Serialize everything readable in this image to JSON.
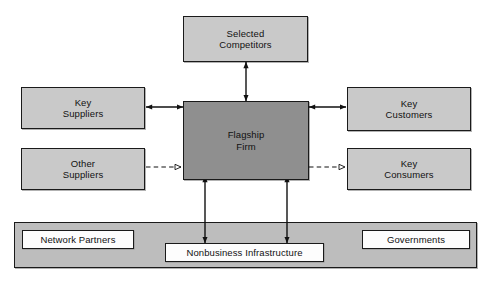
{
  "diagram": {
    "colors": {
      "node_fill": "#c9c9c9",
      "center_fill": "#8f8f8f",
      "envelope_fill": "#bdbdbd",
      "white_fill": "#fdfdfd",
      "stroke": "#1a1a1a",
      "background": "#ffffff"
    },
    "nodes": {
      "selected_competitors": {
        "line1": "Selected",
        "line2": "Competitors"
      },
      "key_suppliers": {
        "line1": "Key",
        "line2": "Suppliers"
      },
      "other_suppliers": {
        "line1": "Other",
        "line2": "Suppliers"
      },
      "flagship_firm": {
        "line1": "Flagship",
        "line2": "Firm"
      },
      "key_customers": {
        "line1": "Key",
        "line2": "Customers"
      },
      "key_consumers": {
        "line1": "Key",
        "line2": "Consumers"
      },
      "network_partners": {
        "label": "Network Partners"
      },
      "nonbusiness_infrastructure": {
        "label": "Nonbusiness Infrastructure"
      },
      "governments": {
        "label": "Governments"
      }
    },
    "connectors": [
      {
        "name": "flagship-to-selected-competitors",
        "style": "solid",
        "heads": "both"
      },
      {
        "name": "key-suppliers-to-flagship",
        "style": "solid",
        "heads": "both"
      },
      {
        "name": "flagship-to-key-customers",
        "style": "solid",
        "heads": "both"
      },
      {
        "name": "other-suppliers-to-flagship",
        "style": "dashed",
        "heads": "end"
      },
      {
        "name": "flagship-to-key-consumers",
        "style": "dashed",
        "heads": "end"
      },
      {
        "name": "flagship-to-infrastructure-left",
        "style": "solid",
        "heads": "both"
      },
      {
        "name": "flagship-to-infrastructure-right",
        "style": "solid",
        "heads": "both"
      }
    ]
  }
}
